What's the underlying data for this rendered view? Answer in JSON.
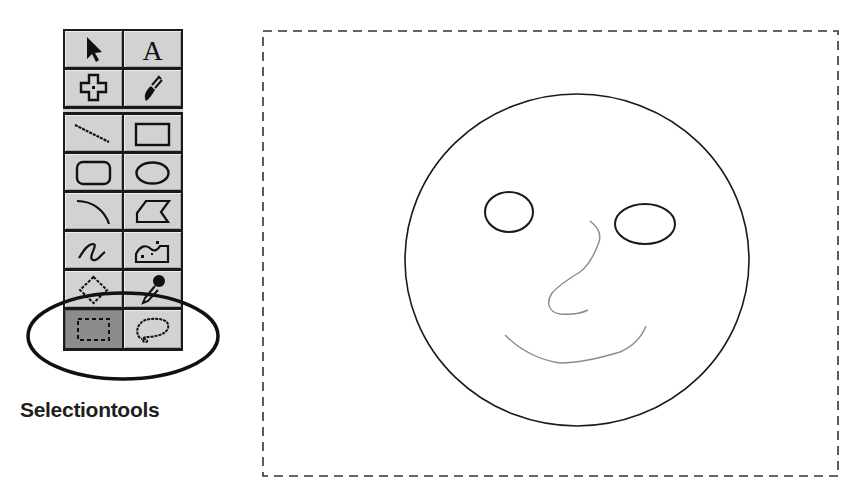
{
  "toolbox": {
    "tools": [
      {
        "name": "arrow-tool",
        "icon": "arrow-pointer-icon",
        "selected": false
      },
      {
        "name": "text-tool",
        "icon": "letter-a-icon",
        "label": "A",
        "selected": false
      },
      {
        "name": "move-tool",
        "icon": "cross-move-icon",
        "selected": false
      },
      {
        "name": "paintbrush-tool",
        "icon": "paintbrush-icon",
        "selected": false
      },
      {
        "name": "line-tool",
        "icon": "line-icon",
        "selected": false
      },
      {
        "name": "rectangle-tool",
        "icon": "rectangle-icon",
        "selected": false
      },
      {
        "name": "rounded-rectangle-tool",
        "icon": "rounded-rectangle-icon",
        "selected": false
      },
      {
        "name": "oval-tool",
        "icon": "oval-icon",
        "selected": false
      },
      {
        "name": "arc-tool",
        "icon": "arc-icon",
        "selected": false
      },
      {
        "name": "polygon-tool",
        "icon": "polygon-icon",
        "selected": false
      },
      {
        "name": "freehand-tool",
        "icon": "freehand-icon",
        "selected": false
      },
      {
        "name": "spray-paint-tool",
        "icon": "spray-paint-icon",
        "selected": false
      },
      {
        "name": "eraser-tool",
        "icon": "diamond-eraser-icon",
        "selected": false
      },
      {
        "name": "eyedropper-tool",
        "icon": "eyedropper-icon",
        "selected": false
      },
      {
        "name": "marquee-selection-tool",
        "icon": "marquee-icon",
        "selected": true
      },
      {
        "name": "lasso-selection-tool",
        "icon": "lasso-icon",
        "selected": false
      }
    ],
    "selected_color": "#8c8c8c",
    "tool_color": "#d2d2d2"
  },
  "annotation": {
    "caption": "Selectiontools",
    "highlight": "ellipse around selection tools"
  },
  "canvas": {
    "border": "dashed",
    "drawing": "smiley face",
    "stroke_color": "#1a1a1a",
    "freehand_color": "#8a8a8a"
  }
}
